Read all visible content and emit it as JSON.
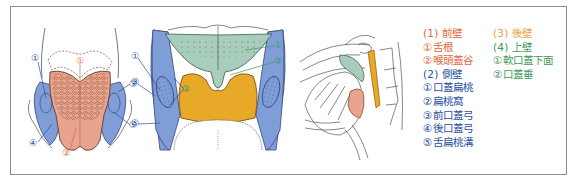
{
  "colors": {
    "border": "#8a8a8a",
    "anterior": "#e06a3a",
    "lateral": "#2a4fa0",
    "posterior": "#e8a33a",
    "superior": "#3f9a5a",
    "tongue_fill": "#e8a48c",
    "lateral_fill": "#7f9ed8",
    "soft_palate_fill": "#a9cdbb",
    "posterior_fill": "#e8a828"
  },
  "figure1": {
    "labels": [
      "①",
      "④",
      "③",
      "⑤",
      "②",
      "①"
    ]
  },
  "figure2": {
    "labels": [
      "①",
      "③",
      "⑤",
      "②",
      "①",
      "②"
    ]
  },
  "legend": {
    "anterior": {
      "heading": "(1) 前壁",
      "items": [
        "①舌根",
        "②喉頭蓋谷"
      ]
    },
    "lateral": {
      "heading": "(2) 側壁",
      "items": [
        "①口蓋扁桃",
        "②扁桃窩",
        "③前口蓋弓",
        "④後口蓋弓",
        "⑤舌扁桃溝"
      ]
    },
    "posterior": {
      "heading": "(3) 後壁"
    },
    "superior": {
      "heading": "(4) 上壁",
      "items": [
        "①軟口蓋下面",
        "②口蓋垂"
      ]
    }
  }
}
